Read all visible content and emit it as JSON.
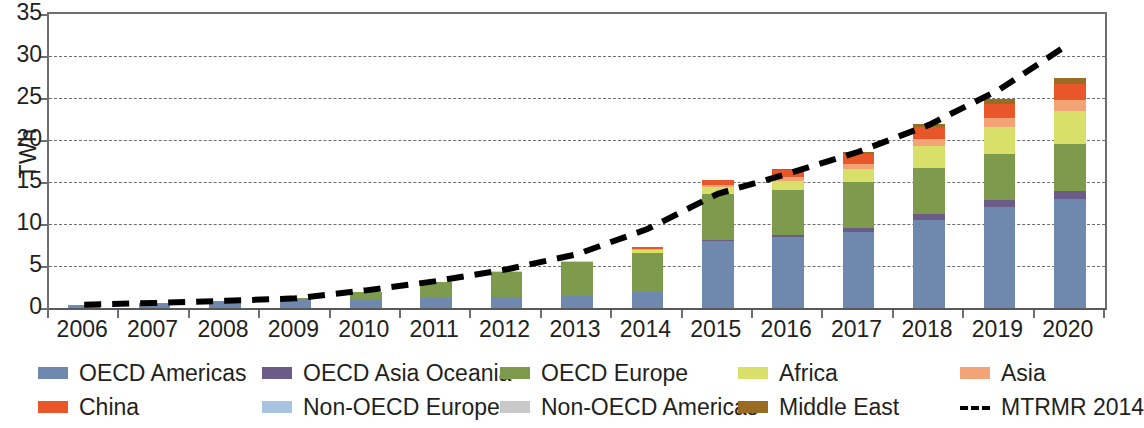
{
  "chart_data": {
    "type": "bar",
    "stacked": true,
    "title": "",
    "xlabel": "",
    "ylabel": "TWh",
    "ylim": [
      0,
      35
    ],
    "yticks": [
      0,
      5,
      10,
      15,
      20,
      25,
      30,
      35
    ],
    "grid": true,
    "legend_position": "bottom",
    "categories": [
      "2006",
      "2007",
      "2008",
      "2009",
      "2010",
      "2011",
      "2012",
      "2013",
      "2014",
      "2015",
      "2016",
      "2017",
      "2018",
      "2019",
      "2020"
    ],
    "series": [
      {
        "name": "OECD Americas",
        "color": "#6e89ad",
        "values": [
          0.3,
          0.45,
          0.7,
          0.9,
          0.95,
          1.2,
          1.35,
          1.45,
          1.85,
          8.0,
          8.4,
          9.0,
          10.5,
          12.0,
          13.0
        ]
      },
      {
        "name": "OECD Asia Oceania",
        "color": "#6b5b87",
        "values": [
          0.0,
          0.0,
          0.0,
          0.0,
          0.0,
          0.0,
          0.0,
          0.0,
          0.0,
          0.1,
          0.25,
          0.55,
          0.75,
          0.85,
          0.95
        ]
      },
      {
        "name": "OECD Europe",
        "color": "#7d9a4d",
        "values": [
          0.05,
          0.1,
          0.15,
          0.25,
          0.95,
          1.85,
          3.05,
          4.1,
          4.75,
          5.45,
          5.35,
          5.4,
          5.45,
          5.45,
          5.6
        ]
      },
      {
        "name": "Africa",
        "color": "#d8e06a",
        "values": [
          0.0,
          0.0,
          0.0,
          0.0,
          0.0,
          0.0,
          0.05,
          0.1,
          0.3,
          0.85,
          1.1,
          1.65,
          2.55,
          3.2,
          3.85
        ]
      },
      {
        "name": "Asia",
        "color": "#f2a477",
        "values": [
          0.0,
          0.0,
          0.0,
          0.0,
          0.0,
          0.0,
          0.0,
          0.0,
          0.1,
          0.25,
          0.45,
          0.6,
          0.85,
          1.1,
          1.35
        ]
      },
      {
        "name": "China",
        "color": "#e8562a",
        "values": [
          0.0,
          0.0,
          0.0,
          0.0,
          0.0,
          0.0,
          0.0,
          0.0,
          0.3,
          0.55,
          0.85,
          1.15,
          1.45,
          1.7,
          1.9
        ]
      },
      {
        "name": "Non-OECD Europe",
        "color": "#a8c4e0",
        "values": [
          0.0,
          0.0,
          0.0,
          0.0,
          0.0,
          0.0,
          0.0,
          0.0,
          0.0,
          0.0,
          0.0,
          0.0,
          0.0,
          0.0,
          0.0
        ]
      },
      {
        "name": "Non-OECD Americas",
        "color": "#c9c9c9",
        "values": [
          0.0,
          0.0,
          0.0,
          0.0,
          0.0,
          0.0,
          0.0,
          0.0,
          0.0,
          0.0,
          0.0,
          0.0,
          0.0,
          0.0,
          0.0
        ]
      },
      {
        "name": "Middle East",
        "color": "#9a6b22",
        "values": [
          0.0,
          0.0,
          0.0,
          0.0,
          0.0,
          0.0,
          0.0,
          0.0,
          0.0,
          0.0,
          0.1,
          0.25,
          0.4,
          0.55,
          0.7
        ]
      }
    ],
    "line_series": [
      {
        "name": "MTRMR 2014",
        "style": "dashed",
        "color": "#000000",
        "values": [
          0.4,
          0.6,
          0.85,
          1.15,
          2.1,
          3.2,
          4.6,
          6.4,
          9.4,
          13.6,
          16.0,
          18.6,
          21.8,
          26.0,
          31.5
        ]
      }
    ]
  },
  "legend": {
    "row1": [
      {
        "label": "OECD Americas",
        "color": "#6e89ad",
        "kind": "swatch"
      },
      {
        "label": "OECD Asia Oceania",
        "color": "#6b5b87",
        "kind": "swatch"
      },
      {
        "label": "OECD Europe",
        "color": "#7d9a4d",
        "kind": "swatch"
      },
      {
        "label": "Africa",
        "color": "#d8e06a",
        "kind": "swatch"
      },
      {
        "label": "Asia",
        "color": "#f2a477",
        "kind": "swatch"
      }
    ],
    "row2": [
      {
        "label": "China",
        "color": "#e8562a",
        "kind": "swatch"
      },
      {
        "label": "Non-OECD Europe",
        "color": "#a8c4e0",
        "kind": "swatch"
      },
      {
        "label": "Non-OECD Americas",
        "color": "#c9c9c9",
        "kind": "swatch"
      },
      {
        "label": "Middle East",
        "color": "#9a6b22",
        "kind": "swatch"
      },
      {
        "label": "MTRMR 2014",
        "color": "#000000",
        "kind": "dash"
      }
    ]
  }
}
